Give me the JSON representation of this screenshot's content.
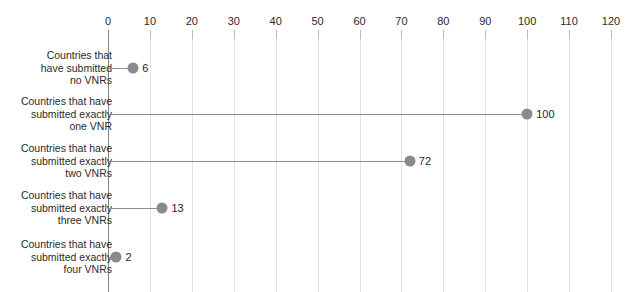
{
  "chart_data": {
    "type": "bar",
    "subtype": "lollipop-horizontal",
    "title": "",
    "subtitle": "",
    "xlabel": "",
    "ylabel": "",
    "categories": [
      "Countries that have submitted no VNRs",
      "Countries that have submitted exactly one VNR",
      "Countries that have submitted exactly two VNRs",
      "Countries that have submitted exactly three VNRs",
      "Countries that have submitted exactly four VNRs"
    ],
    "values": [
      6,
      100,
      72,
      13,
      2
    ],
    "data_labels": [
      "6",
      "100",
      "72",
      "13",
      "2"
    ],
    "xlim": [
      0,
      120
    ],
    "xticks": [
      0,
      10,
      20,
      30,
      40,
      50,
      60,
      70,
      80,
      90,
      100,
      110,
      120
    ],
    "xtick_labels": [
      "0",
      "10",
      "20",
      "30",
      "40",
      "50",
      "60",
      "70",
      "80",
      "90",
      "100",
      "110",
      "120"
    ],
    "grid": "vertical",
    "legend": "none",
    "marker_color": "#8a8a8a",
    "stem_color": "#8c8c8c",
    "grid_color": "#e3e3e3",
    "axis_color": "#868686",
    "text_color": "#2b2b2b"
  },
  "axis": {
    "category_labels": [
      {
        "line1": "Countries that",
        "line2": "have submitted",
        "line3": "no VNRs"
      },
      {
        "line1": "Countries that have",
        "line2": "submitted exactly",
        "line3": "one VNR"
      },
      {
        "line1": "Countries that have",
        "line2": "submitted exactly",
        "line3": "two VNRs"
      },
      {
        "line1": "Countries that have",
        "line2": "submitted exactly",
        "line3": "three VNRs"
      },
      {
        "line1": "Countries that have",
        "line2": "submitted exactly",
        "line3": "four VNRs"
      }
    ]
  }
}
